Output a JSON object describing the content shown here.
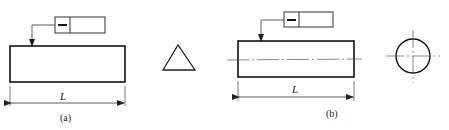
{
  "figure": {
    "type": "engineering-drawing",
    "subfigures": [
      {
        "id": "a",
        "caption": "(a)",
        "tolerance_frame": {
          "symbol": "—",
          "symbol_name": "straightness",
          "value": ""
        },
        "dimension_label": "L",
        "part_shape": "rectangle"
      },
      {
        "id": "b",
        "caption": "(b)",
        "tolerance_frame": {
          "symbol": "—",
          "symbol_name": "straightness",
          "value": ""
        },
        "dimension_label": "L",
        "part_shape": "rectangle-with-centerline"
      }
    ],
    "views": [
      {
        "id": "triangle-view",
        "shape": "triangle"
      },
      {
        "id": "circle-view",
        "shape": "circle-with-centerlines"
      }
    ]
  },
  "colors": {
    "line": "#222222",
    "centerline": "#555555",
    "background": "#ffffff"
  }
}
